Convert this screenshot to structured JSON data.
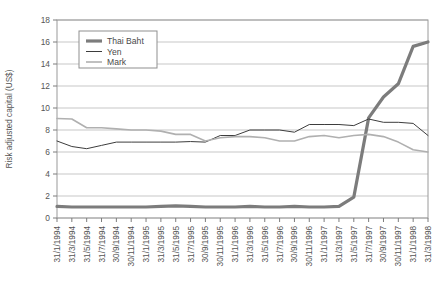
{
  "figure": {
    "title_clipped": "",
    "background_color": "#ffffff",
    "plot_border_color": "#9a9a9a",
    "grid_color": "#b9b9b9"
  },
  "legend": {
    "position": "top-left-inside",
    "entries": [
      {
        "label": "Thai Baht",
        "color": "#7c7c7c",
        "width": 3.2
      },
      {
        "label": "Yen",
        "color": "#3d3d3d",
        "width": 1.0
      },
      {
        "label": "Mark",
        "color": "#b0b0b0",
        "width": 1.6
      }
    ]
  },
  "chart_data": {
    "type": "line",
    "title": "",
    "xlabel": "",
    "ylabel": "Risk adjusted capital (US$)",
    "ylim": [
      0,
      18
    ],
    "yticks": [
      0,
      2,
      4,
      6,
      8,
      10,
      12,
      14,
      16,
      18
    ],
    "ytick_labels": [
      "0",
      "2",
      "4",
      "6",
      "8",
      "10",
      "12",
      "14",
      "16",
      "18"
    ],
    "grid": true,
    "grid_axis": "y",
    "legend_position": "upper left",
    "categories": [
      "31/1/1994",
      "31/3/1994",
      "31/5/1994",
      "31/7/1994",
      "30/9/1994",
      "30/11/1994",
      "31/1/1995",
      "31/3/1995",
      "31/5/1995",
      "31/7/1995",
      "30/9/1995",
      "30/11/1995",
      "31/1/1996",
      "31/3/1996",
      "31/5/1996",
      "31/7/1996",
      "30/9/1996",
      "30/11/1996",
      "31/1/1997",
      "31/3/1997",
      "31/5/1997",
      "31/7/1997",
      "30/9/1997",
      "30/11/1997",
      "31/1/1998",
      "31/3/1998"
    ],
    "series": [
      {
        "name": "Thai Baht",
        "color": "#7c7c7c",
        "width": 3.2,
        "values": [
          1.05,
          1.0,
          1.0,
          1.0,
          1.0,
          1.0,
          1.0,
          1.05,
          1.1,
          1.05,
          1.0,
          1.0,
          1.0,
          1.05,
          1.0,
          1.0,
          1.05,
          1.0,
          1.0,
          1.05,
          1.9,
          9.1,
          11.0,
          12.2,
          15.6,
          16.0
        ]
      },
      {
        "name": "Yen",
        "color": "#3d3d3d",
        "width": 1.0,
        "values": [
          7.0,
          6.5,
          6.3,
          6.6,
          6.9,
          6.9,
          6.9,
          6.9,
          6.9,
          6.95,
          6.9,
          7.5,
          7.5,
          8.0,
          8.0,
          8.0,
          7.8,
          8.5,
          8.5,
          8.5,
          8.4,
          9.0,
          8.7,
          8.7,
          8.6,
          7.5
        ]
      },
      {
        "name": "Mark",
        "color": "#b0b0b0",
        "width": 1.6,
        "values": [
          9.05,
          9.0,
          8.2,
          8.2,
          8.1,
          8.0,
          8.0,
          7.9,
          7.6,
          7.6,
          7.0,
          7.3,
          7.4,
          7.4,
          7.3,
          7.0,
          7.0,
          7.4,
          7.5,
          7.3,
          7.5,
          7.6,
          7.4,
          6.9,
          6.2,
          6.0
        ]
      }
    ]
  }
}
